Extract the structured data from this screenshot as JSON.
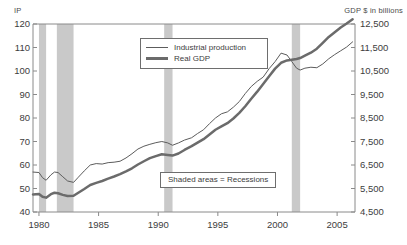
{
  "chart_data": {
    "type": "line",
    "title": "",
    "xlabel": "",
    "ylabel": "IP",
    "y2label": "GDP $ in billions",
    "grid": false,
    "legend_position": "top-center",
    "xlim": [
      1979.5,
      2006.5
    ],
    "ylim": [
      40,
      120
    ],
    "y2lim": [
      4500,
      12500
    ],
    "xticks": [
      "1980",
      "1985",
      "1990",
      "1995",
      "2000",
      "2005"
    ],
    "xtick_values": [
      1980,
      1985,
      1990,
      1995,
      2000,
      2005
    ],
    "yticks": [
      "40",
      "50",
      "60",
      "70",
      "80",
      "90",
      "100",
      "110",
      "120"
    ],
    "ytick_values": [
      40,
      50,
      60,
      70,
      80,
      90,
      100,
      110,
      120
    ],
    "y2ticks": [
      "4,500",
      "5,500",
      "6,500",
      "7,500",
      "8,500",
      "9,500",
      "10,500",
      "11,500",
      "12,500"
    ],
    "y2tick_values": [
      4500,
      5500,
      6500,
      7500,
      8500,
      9500,
      10500,
      11500,
      12500
    ],
    "annotations": [
      {
        "text": "Shaded areas = Recessions"
      }
    ],
    "shaded_regions": {
      "label": "Recessions",
      "color": "#c9c9c9",
      "bands": [
        {
          "start": 1980.0,
          "end": 1980.6
        },
        {
          "start": 1981.5,
          "end": 1982.9
        },
        {
          "start": 1990.5,
          "end": 1991.2
        },
        {
          "start": 2001.2,
          "end": 2001.9
        }
      ]
    },
    "series": [
      {
        "name": "Industrial production",
        "axis": "left",
        "color": "#5c5c5c",
        "width": 1,
        "x": [
          1979.5,
          1980.0,
          1980.3,
          1980.6,
          1981.0,
          1981.3,
          1981.6,
          1982.0,
          1982.4,
          1982.9,
          1983.3,
          1983.8,
          1984.3,
          1984.8,
          1985.3,
          1985.8,
          1986.3,
          1986.8,
          1987.3,
          1987.8,
          1988.3,
          1988.8,
          1989.3,
          1989.8,
          1990.3,
          1990.8,
          1991.2,
          1991.7,
          1992.2,
          1992.8,
          1993.3,
          1993.8,
          1994.3,
          1994.8,
          1995.3,
          1995.8,
          1996.3,
          1996.8,
          1997.3,
          1997.8,
          1998.3,
          1998.8,
          1999.3,
          1999.8,
          2000.3,
          2000.8,
          2001.2,
          2001.6,
          2001.9,
          2002.3,
          2002.8,
          2003.3,
          2003.8,
          2004.3,
          2004.8,
          2005.3,
          2005.8,
          2006.3
        ],
        "values": [
          57.0,
          56.8,
          54.6,
          53.5,
          55.8,
          57.0,
          56.8,
          55.0,
          53.2,
          52.6,
          54.8,
          57.5,
          60.0,
          60.6,
          60.4,
          61.0,
          61.2,
          61.6,
          63.0,
          64.8,
          66.8,
          68.0,
          68.8,
          69.5,
          70.0,
          69.4,
          68.4,
          69.4,
          70.6,
          71.6,
          73.4,
          75.0,
          77.6,
          80.0,
          81.8,
          82.6,
          84.6,
          87.0,
          90.4,
          93.4,
          95.6,
          97.4,
          101.0,
          104.0,
          107.6,
          106.8,
          104.0,
          101.2,
          100.4,
          101.2,
          101.6,
          101.4,
          103.0,
          105.2,
          107.0,
          108.6,
          110.2,
          112.4
        ]
      },
      {
        "name": "Real GDP",
        "axis": "right",
        "color": "#6b6b6b",
        "width": 2.5,
        "x": [
          1979.5,
          1980.0,
          1980.3,
          1980.6,
          1981.0,
          1981.3,
          1981.6,
          1982.0,
          1982.4,
          1982.9,
          1983.3,
          1983.8,
          1984.3,
          1984.8,
          1985.3,
          1985.8,
          1986.3,
          1986.8,
          1987.3,
          1987.8,
          1988.3,
          1988.8,
          1989.3,
          1989.8,
          1990.3,
          1990.8,
          1991.2,
          1991.7,
          1992.2,
          1992.8,
          1993.3,
          1993.8,
          1994.3,
          1994.8,
          1995.3,
          1995.8,
          1996.3,
          1996.8,
          1997.3,
          1997.8,
          1998.3,
          1998.8,
          1999.3,
          1999.8,
          2000.3,
          2000.8,
          2001.2,
          2001.6,
          2001.9,
          2002.3,
          2002.8,
          2003.3,
          2003.8,
          2004.3,
          2004.8,
          2005.3,
          2005.8,
          2006.3
        ],
        "values": [
          5250,
          5270,
          5150,
          5110,
          5260,
          5320,
          5300,
          5230,
          5180,
          5190,
          5320,
          5480,
          5650,
          5740,
          5820,
          5920,
          6010,
          6110,
          6230,
          6360,
          6520,
          6660,
          6790,
          6880,
          6960,
          6930,
          6900,
          6990,
          7140,
          7300,
          7450,
          7600,
          7800,
          8000,
          8140,
          8280,
          8480,
          8720,
          9000,
          9320,
          9620,
          9950,
          10280,
          10600,
          10850,
          10950,
          10980,
          11010,
          11050,
          11150,
          11280,
          11450,
          11700,
          11950,
          12150,
          12350,
          12520,
          12700
        ]
      }
    ]
  },
  "legend": {
    "items": [
      {
        "label": "Industrial production",
        "style": "thin"
      },
      {
        "label": "Real GDP",
        "style": "thick"
      }
    ]
  },
  "note": {
    "text": "Shaded areas = Recessions"
  },
  "axes": {
    "left_title": "IP",
    "right_title": "GDP $ in billions"
  },
  "colors": {
    "line": "#5c5c5c",
    "shade": "#c9c9c9",
    "frame": "#8a8a8a",
    "text": "#3d3d3d"
  }
}
